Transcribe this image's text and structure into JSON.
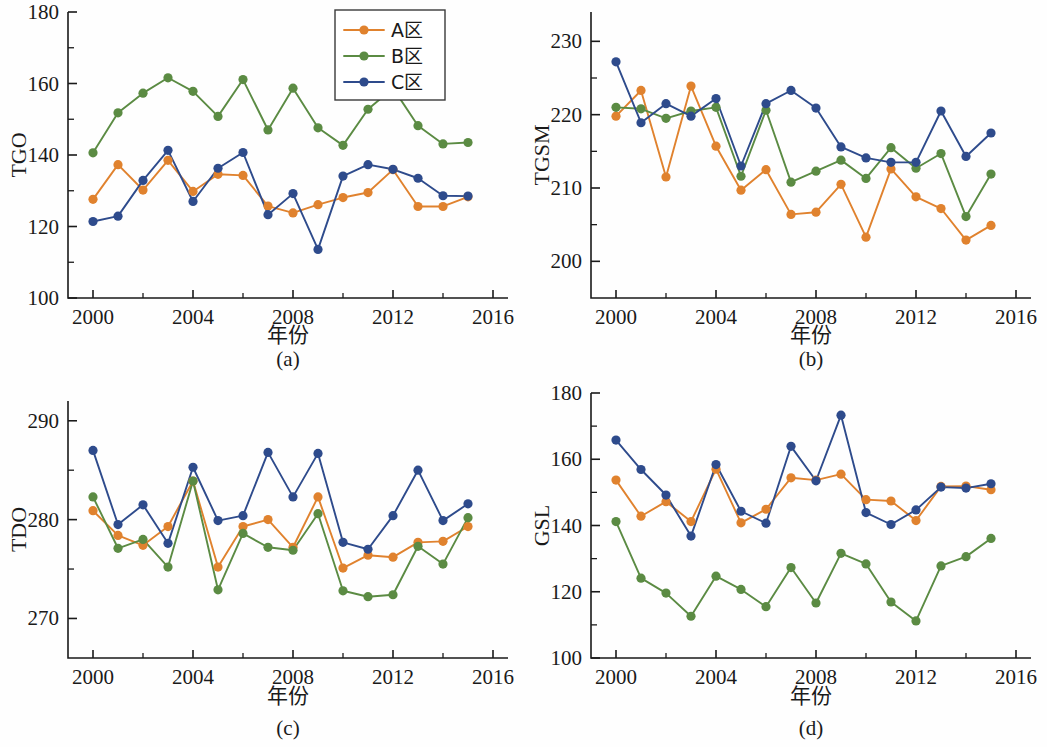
{
  "figure": {
    "background_color": "#fefefe",
    "series_colors": {
      "A": "#E0822E",
      "B": "#5B8B43",
      "C": "#2E4B8C"
    },
    "legend": {
      "position": "top-right of panel (a)",
      "entries": [
        "A区",
        "B区",
        "C区"
      ]
    },
    "panels": [
      {
        "key": "a",
        "caption": "(a)",
        "ylabel": "TGO",
        "xlabel": "年份"
      },
      {
        "key": "b",
        "caption": "(b)",
        "ylabel": "TGSM",
        "xlabel": "年份"
      },
      {
        "key": "c",
        "caption": "(c)",
        "ylabel": "TDO",
        "xlabel": "年份"
      },
      {
        "key": "d",
        "caption": "(d)",
        "ylabel": "GSL",
        "xlabel": "年份"
      }
    ]
  },
  "chart_data": [
    {
      "id": "a",
      "type": "line",
      "title": "(a)",
      "xlabel": "年份",
      "ylabel": "TGO",
      "xlim": [
        1999,
        2016.6
      ],
      "ylim": [
        100,
        180
      ],
      "xticks": [
        2000,
        2004,
        2008,
        2012,
        2016
      ],
      "xticklabels": [
        "2000",
        "2004",
        "2008",
        "2012",
        "2016"
      ],
      "xminorticks": [
        2002,
        2006,
        2010,
        2014
      ],
      "yticks": [
        100,
        120,
        140,
        160,
        180
      ],
      "yticklabels": [
        "100",
        "120",
        "140",
        "160",
        "180"
      ],
      "yminorticks": [
        110,
        130,
        150,
        170
      ],
      "grid": false,
      "x": [
        2000,
        2001,
        2002,
        2003,
        2004,
        2005,
        2006,
        2007,
        2008,
        2009,
        2010,
        2011,
        2012,
        2013,
        2014,
        2015
      ],
      "series": [
        {
          "name": "A区",
          "color": "#E0822E",
          "values": [
            127.6,
            137.3,
            130.2,
            138.5,
            129.8,
            134.6,
            134.3,
            125.7,
            123.8,
            126.1,
            128.1,
            129.5,
            135.9,
            125.6,
            125.6,
            128.3
          ]
        },
        {
          "name": "B区",
          "color": "#5B8B43",
          "values": [
            140.6,
            151.8,
            157.3,
            161.6,
            157.8,
            150.8,
            161.1,
            147.0,
            158.7,
            147.6,
            142.7,
            152.8,
            158.7,
            148.2,
            143.1,
            143.5
          ]
        },
        {
          "name": "C区",
          "color": "#2E4B8C",
          "values": [
            121.4,
            122.9,
            132.9,
            141.3,
            127.0,
            136.3,
            140.7,
            123.3,
            129.2,
            113.6,
            134.1,
            137.3,
            136.0,
            133.5,
            128.6,
            128.5
          ]
        }
      ]
    },
    {
      "id": "b",
      "type": "line",
      "title": "(b)",
      "xlabel": "年份",
      "ylabel": "TGSM",
      "xlim": [
        1999,
        2016.6
      ],
      "ylim": [
        195,
        234
      ],
      "xticks": [
        2000,
        2004,
        2008,
        2012,
        2016
      ],
      "xticklabels": [
        "2000",
        "2004",
        "2008",
        "2012",
        "2016"
      ],
      "xminorticks": [
        2002,
        2006,
        2010,
        2014
      ],
      "yticks": [
        200,
        210,
        220,
        230
      ],
      "yticklabels": [
        "200",
        "210",
        "220",
        "230"
      ],
      "yminorticks": [
        205,
        215,
        225
      ],
      "grid": false,
      "x": [
        2000,
        2001,
        2002,
        2003,
        2004,
        2005,
        2006,
        2007,
        2008,
        2009,
        2010,
        2011,
        2012,
        2013,
        2014,
        2015
      ],
      "series": [
        {
          "name": "A区",
          "color": "#E0822E",
          "values": [
            219.8,
            223.3,
            211.5,
            223.9,
            215.7,
            209.7,
            212.5,
            206.4,
            206.7,
            210.5,
            203.3,
            212.6,
            208.8,
            207.2,
            202.9,
            204.9
          ]
        },
        {
          "name": "B区",
          "color": "#5B8B43",
          "values": [
            221.0,
            220.8,
            219.5,
            220.5,
            221.0,
            211.6,
            220.6,
            210.8,
            212.3,
            213.8,
            211.3,
            215.5,
            212.7,
            214.7,
            206.1,
            211.9
          ]
        },
        {
          "name": "C区",
          "color": "#2E4B8C",
          "values": [
            227.2,
            218.9,
            221.5,
            219.8,
            222.2,
            213.0,
            221.5,
            223.3,
            220.9,
            215.6,
            214.1,
            213.5,
            213.5,
            220.5,
            214.3,
            217.5
          ]
        }
      ]
    },
    {
      "id": "c",
      "type": "line",
      "title": "(c)",
      "xlabel": "年份",
      "ylabel": "TDO",
      "xlim": [
        1999,
        2016.6
      ],
      "ylim": [
        266,
        292
      ],
      "xticks": [
        2000,
        2004,
        2008,
        2012,
        2016
      ],
      "xticklabels": [
        "2000",
        "2004",
        "2008",
        "2012",
        "2016"
      ],
      "xminorticks": [
        2002,
        2006,
        2010,
        2014
      ],
      "yticks": [
        270,
        280,
        290
      ],
      "yticklabels": [
        "270",
        "280",
        "290"
      ],
      "yminorticks": [
        275,
        285
      ],
      "grid": false,
      "x": [
        2000,
        2001,
        2002,
        2003,
        2004,
        2005,
        2006,
        2007,
        2008,
        2009,
        2010,
        2011,
        2012,
        2013,
        2014,
        2015
      ],
      "series": [
        {
          "name": "A区",
          "color": "#E0822E",
          "values": [
            280.9,
            278.4,
            277.4,
            279.3,
            283.9,
            275.2,
            279.3,
            280.0,
            277.2,
            282.3,
            275.1,
            276.4,
            276.2,
            277.7,
            277.8,
            279.3
          ]
        },
        {
          "name": "B区",
          "color": "#5B8B43",
          "values": [
            282.3,
            277.1,
            278.0,
            275.2,
            283.9,
            272.9,
            278.6,
            277.2,
            276.9,
            280.6,
            272.8,
            272.2,
            272.4,
            277.3,
            275.5,
            280.2
          ]
        },
        {
          "name": "C区",
          "color": "#2E4B8C",
          "values": [
            287.0,
            279.5,
            281.5,
            277.6,
            285.3,
            279.9,
            280.4,
            286.8,
            282.3,
            286.7,
            277.7,
            277.0,
            280.4,
            285.0,
            279.9,
            281.6
          ]
        }
      ]
    },
    {
      "id": "d",
      "type": "line",
      "title": "(d)",
      "xlabel": "年份",
      "ylabel": "GSL",
      "xlim": [
        1999,
        2016.6
      ],
      "ylim": [
        100,
        180
      ],
      "xticks": [
        2000,
        2004,
        2008,
        2012,
        2016
      ],
      "xticklabels": [
        "2000",
        "2004",
        "2008",
        "2012",
        "2016"
      ],
      "xminorticks": [
        2002,
        2006,
        2010,
        2014
      ],
      "yticks": [
        100,
        120,
        140,
        160,
        180
      ],
      "yticklabels": [
        "100",
        "120",
        "140",
        "160",
        "180"
      ],
      "yminorticks": [
        110,
        130,
        150,
        170
      ],
      "grid": false,
      "x": [
        2000,
        2001,
        2002,
        2003,
        2004,
        2005,
        2006,
        2007,
        2008,
        2009,
        2010,
        2011,
        2012,
        2013,
        2014,
        2015
      ],
      "series": [
        {
          "name": "A区",
          "color": "#E0822E",
          "values": [
            153.7,
            142.8,
            147.2,
            141.2,
            157.0,
            140.8,
            144.9,
            154.4,
            153.7,
            155.5,
            147.8,
            147.4,
            141.5,
            151.8,
            151.9,
            150.8
          ]
        },
        {
          "name": "B区",
          "color": "#5B8B43",
          "values": [
            141.2,
            124.1,
            119.6,
            112.6,
            124.7,
            120.7,
            115.5,
            127.3,
            116.6,
            131.6,
            128.4,
            116.9,
            111.2,
            127.8,
            130.6,
            136.1
          ]
        },
        {
          "name": "C区",
          "color": "#2E4B8C",
          "values": [
            165.8,
            156.9,
            149.2,
            136.8,
            158.4,
            144.3,
            140.7,
            163.9,
            153.5,
            173.3,
            143.9,
            140.3,
            144.7,
            151.6,
            151.3,
            152.6
          ]
        }
      ]
    }
  ]
}
